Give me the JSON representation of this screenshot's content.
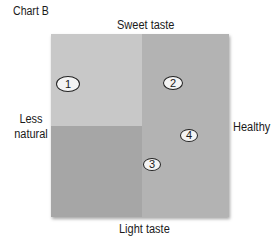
{
  "title": "Chart B",
  "axes": {
    "top": "Sweet taste",
    "bottom": "Light taste",
    "left": "Less natural",
    "right": "Healthy"
  },
  "quadrant_colors": {
    "top_left": "#c8c8c8",
    "top_right": "#b3b3b3",
    "bottom_left": "#a6a6a6",
    "bottom_right": "#b3b3b3"
  },
  "markers": [
    {
      "label": "1",
      "x": 68,
      "y": 84,
      "w": 24,
      "h": 16
    },
    {
      "label": "2",
      "x": 173,
      "y": 83,
      "w": 20,
      "h": 14
    },
    {
      "label": "3",
      "x": 152,
      "y": 164,
      "w": 18,
      "h": 13
    },
    {
      "label": "4",
      "x": 189,
      "y": 135,
      "w": 18,
      "h": 13
    }
  ]
}
